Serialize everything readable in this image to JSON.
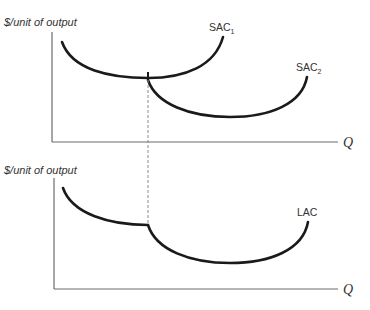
{
  "top_panel": {
    "y_axis_label": "$/unit of output",
    "x_axis_label": "Q",
    "curves": [
      {
        "name": "SAC",
        "subscript": "1"
      },
      {
        "name": "SAC",
        "subscript": "2"
      }
    ]
  },
  "bottom_panel": {
    "y_axis_label": "$/unit of output",
    "x_axis_label": "Q",
    "curves": [
      {
        "name": "LAC"
      }
    ]
  },
  "colors": {
    "curve": "#1a1a1a",
    "axis": "#6b6b6b",
    "dashed_guide": "#8a8a8a",
    "text": "#333333",
    "background": "#ffffff"
  }
}
